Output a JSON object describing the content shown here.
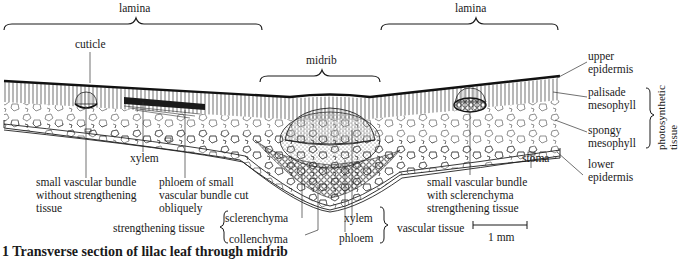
{
  "figure": {
    "caption": "1 Transverse section of lilac leaf through midrib",
    "scale_bar": "1 mm"
  },
  "regions": {
    "lamina_left": "lamina",
    "lamina_right": "lamina",
    "midrib": "midrib"
  },
  "labels": {
    "cuticle": "cuticle",
    "upper_epidermis": "upper\nepidermis",
    "palisade_mesophyll": "palisade\nmesophyll",
    "spongy_mesophyll": "spongy\nmesophyll",
    "lower_epidermis": "lower\nepidermis",
    "photosynthetic_tissue": "photosynthetic\ntissue",
    "stoma": "stoma",
    "xylem_small": "xylem",
    "small_bundle_no_strengthening": "small vascular bundle\nwithout strengthening\ntissue",
    "phloem_oblique": "phloem of small\nvascular bundle cut\nobliquely",
    "small_bundle_sclerenchyma": "small vascular bundle\nwith sclerenchyma\nstrengthening tissue",
    "strengthening_tissue": "strengthening tissue",
    "sclerenchyma": "sclerenchyma",
    "collenchyma": "collenchyma",
    "xylem": "xylem",
    "phloem": "phloem",
    "vascular_tissue": "vascular tissue"
  },
  "colors": {
    "ink": "#1a1a1a",
    "background": "#ffffff"
  }
}
